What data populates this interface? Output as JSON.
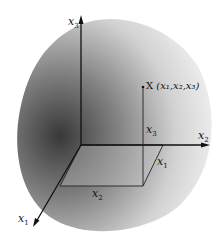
{
  "diagram": {
    "type": "3d-coordinate-system",
    "axes": {
      "x1": {
        "label": "x",
        "sub": "1"
      },
      "x2": {
        "label": "x",
        "sub": "2"
      },
      "x3": {
        "label": "x",
        "sub": "3"
      }
    },
    "point": {
      "label": "X",
      "coords": "(x₁,x₂,x₃)"
    },
    "components": {
      "x1": {
        "label": "x",
        "sub": "1"
      },
      "x2": {
        "label": "x",
        "sub": "2"
      },
      "x3": {
        "label": "x",
        "sub": "3"
      }
    },
    "colors": {
      "axis": "#111111",
      "shade_dark": "#3a3a3a",
      "shade_light": "#f2f2f2"
    }
  }
}
